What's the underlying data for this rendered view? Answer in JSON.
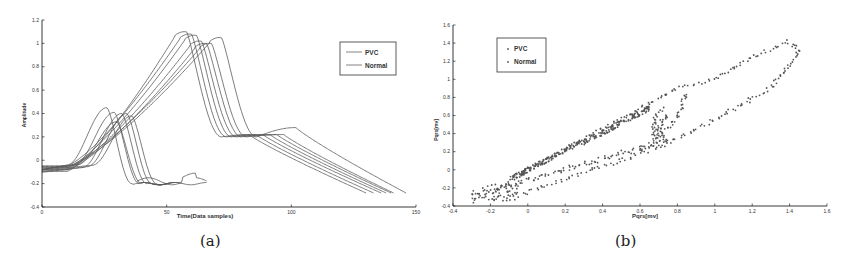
{
  "chart_data": [
    {
      "id": "a",
      "type": "line",
      "caption": "(a)",
      "title": "",
      "xlabel": "Time(Data samples)",
      "ylabel": "Amplitude",
      "xlim": [
        0,
        150
      ],
      "ylim": [
        -0.4,
        1.2
      ],
      "xticks": [
        0,
        50,
        100,
        150
      ],
      "yticks": [
        -0.4,
        -0.2,
        0,
        0.2,
        0.4,
        0.6,
        0.8,
        1,
        1.2
      ],
      "grid": false,
      "legend": {
        "position": "upper right",
        "entries": [
          "PVC",
          "Normal"
        ]
      },
      "series": [
        {
          "name": "Normal",
          "description": "narrow QRS beats, peak ~0.4-0.45 around samples 25-38, fall to ~-0.2 by samples 40-50",
          "beats": [
            {
              "peak_x": 26,
              "peak_y": 0.45,
              "end_x": 48
            },
            {
              "peak_x": 29,
              "peak_y": 0.41,
              "end_x": 50
            },
            {
              "peak_x": 32,
              "peak_y": 0.4,
              "end_x": 52
            },
            {
              "peak_x": 34,
              "peak_y": 0.4,
              "end_x": 54
            },
            {
              "peak_x": 36,
              "peak_y": 0.38,
              "end_x": 56
            },
            {
              "peak_x": 30,
              "peak_y": 0.33,
              "end_x": 66
            }
          ]
        },
        {
          "name": "PVC",
          "description": "wide beats, peak ~1.0-1.1 around samples 55-75, secondary hump ~0.2-0.3 near samples 90-100, decaying to ~-0.3 by samples 130-145",
          "beats": [
            {
              "peak_x": 56,
              "peak_y": 1.1,
              "end_x": 130
            },
            {
              "peak_x": 58,
              "peak_y": 1.08,
              "end_x": 133
            },
            {
              "peak_x": 60,
              "peak_y": 1.07,
              "end_x": 136
            },
            {
              "peak_x": 62,
              "peak_y": 1.02,
              "end_x": 138
            },
            {
              "peak_x": 64,
              "peak_y": 1.0,
              "end_x": 140
            },
            {
              "peak_x": 66,
              "peak_y": 1.0,
              "end_x": 141
            },
            {
              "peak_x": 70,
              "peak_y": 1.05,
              "end_x": 146
            }
          ]
        }
      ]
    },
    {
      "id": "b",
      "type": "scatter",
      "caption": "(b)",
      "title": "",
      "xlabel": "Pqrs[mv]",
      "ylabel": "Pqrs[mv]",
      "xlim": [
        -0.4,
        1.6
      ],
      "ylim": [
        -0.4,
        1.6
      ],
      "xticks": [
        -0.4,
        -0.2,
        0,
        0.2,
        0.4,
        0.6,
        0.8,
        1,
        1.2,
        1.4,
        1.6
      ],
      "yticks": [
        -0.4,
        -0.2,
        0,
        0.2,
        0.4,
        0.6,
        0.8,
        1,
        1.2,
        1.4,
        1.6
      ],
      "grid": false,
      "legend": {
        "position": "upper left",
        "entries": [
          "PVC",
          "Normal"
        ]
      },
      "series": [
        {
          "name": "Normal",
          "description": "dense diagonal band from (-0.1,-0.1) to (0.6,0.7) with loops closing back near (0.6-0.75, 0.2-0.7)",
          "loops": [
            {
              "upper_end": [
                0.72,
                0.68
              ],
              "lower_end": [
                0.65,
                0.25
              ]
            },
            {
              "upper_end": [
                0.75,
                0.6
              ],
              "lower_end": [
                0.68,
                0.3
              ]
            }
          ]
        },
        {
          "name": "PVC",
          "description": "wide elongated loop: upper branch rises from (0,0) to (1.4,1.42); lower branch returns from (1.45,1.3) via (1.0,0.55) and (0.5,0.1) to (-0.3,-0.35)",
          "points_outline": [
            [
              -0.3,
              -0.35
            ],
            [
              -0.1,
              -0.15
            ],
            [
              0.0,
              0.0
            ],
            [
              0.4,
              0.45
            ],
            [
              0.8,
              0.9
            ],
            [
              1.0,
              1.0
            ],
            [
              1.2,
              1.25
            ],
            [
              1.4,
              1.42
            ],
            [
              1.45,
              1.3
            ],
            [
              1.3,
              0.9
            ],
            [
              1.0,
              0.55
            ],
            [
              0.8,
              0.35
            ],
            [
              0.5,
              0.1
            ],
            [
              0.2,
              -0.1
            ],
            [
              0.0,
              -0.25
            ],
            [
              -0.2,
              -0.32
            ]
          ]
        }
      ]
    }
  ]
}
